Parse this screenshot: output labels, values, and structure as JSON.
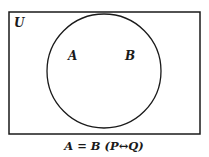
{
  "diagram": {
    "type": "venn",
    "universe_label": "U",
    "sets": [
      {
        "label": "A"
      },
      {
        "label": "B"
      }
    ],
    "caption": "A = B  (P↔Q)",
    "caption_parts": {
      "relation": "A = B",
      "logic": "(P",
      "arrow": "↔",
      "logic_end": "Q)"
    },
    "colors": {
      "stroke": "#1a1a1a",
      "background": "#ffffff"
    }
  }
}
